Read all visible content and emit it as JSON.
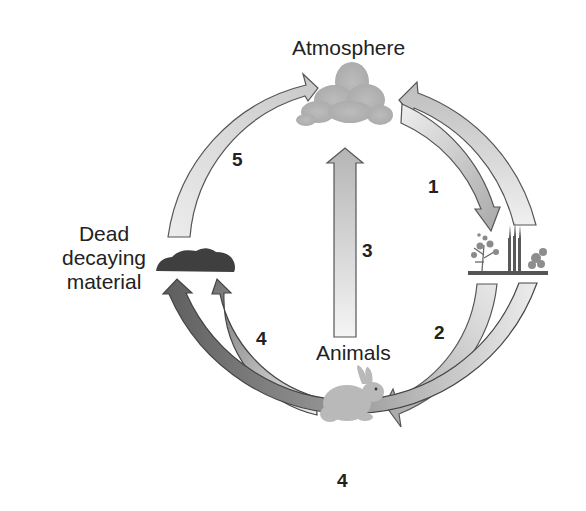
{
  "diagram": {
    "nodes": {
      "atmosphere": "Atmosphere",
      "dead_material_line1": "Dead",
      "dead_material_line2": "decaying",
      "dead_material_line3": "material",
      "animals": "Animals"
    },
    "arrows": [
      {
        "id": "1",
        "label": "1",
        "from": "Atmosphere",
        "to": "Plants"
      },
      {
        "id": "2",
        "label": "2",
        "from": "Plants",
        "to": "Animals"
      },
      {
        "id": "3",
        "label": "3",
        "from": "Animals",
        "to": "Atmosphere"
      },
      {
        "id": "4a",
        "label": "4",
        "from": "Animals",
        "to": "Dead decaying material"
      },
      {
        "id": "4b",
        "label": "4",
        "from": "Plants",
        "to": "Dead decaying material"
      },
      {
        "id": "5",
        "label": "5",
        "from": "Dead decaying material",
        "to": "Atmosphere"
      },
      {
        "id": "6",
        "label": "",
        "from": "Plants",
        "to": "Atmosphere"
      }
    ],
    "colors": {
      "arrow_light": "#e6e6e6",
      "arrow_mid": "#bdbdbd",
      "arrow_dark": "#6a6a6a",
      "cloud": "#b9b9b9",
      "decay": "#3f3f3f",
      "outline": "#555555"
    }
  }
}
